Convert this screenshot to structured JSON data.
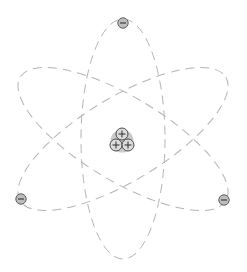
{
  "diagram": {
    "type": "atom-model",
    "center": [
      123,
      139
    ],
    "colors": {
      "background": "#ffffff",
      "orbit": "#b4b4b4",
      "electron_fill": "#bdbdbd",
      "electron_stroke": "#5e5e5e",
      "proton_fill": "#dcdcdc",
      "proton_stroke": "#4a4a4a",
      "nucleus_halo": "#c9c9c9"
    },
    "orbits": [
      {
        "name": "vertical-orbit",
        "rx": 42,
        "ry": 120,
        "rotation": 0
      },
      {
        "name": "tilted-orbit-positive",
        "rx": 120,
        "ry": 42,
        "rotation": 31
      },
      {
        "name": "tilted-orbit-negative",
        "rx": 120,
        "ry": 42,
        "rotation": -31
      }
    ],
    "electrons": [
      {
        "name": "electron-top",
        "x": 123,
        "y": 23,
        "sign": "−"
      },
      {
        "name": "electron-bottom-left",
        "x": 21,
        "y": 199,
        "sign": "−"
      },
      {
        "name": "electron-bottom-right",
        "x": 224,
        "y": 200,
        "sign": "−"
      }
    ],
    "nucleus": {
      "halo_radius": 11,
      "protons": [
        {
          "name": "proton-top",
          "x": 122,
          "y": 134,
          "sign": "+"
        },
        {
          "name": "proton-bottom-left",
          "x": 116,
          "y": 145,
          "sign": "+"
        },
        {
          "name": "proton-bottom-right",
          "x": 128,
          "y": 145,
          "sign": "+"
        }
      ]
    },
    "counts": {
      "electrons": 3,
      "protons": 3,
      "orbits": 3
    }
  }
}
